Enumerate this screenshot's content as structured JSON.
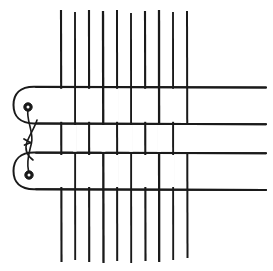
{
  "figure": {
    "background_color": "#ffffff",
    "ink_color": "#1a1a1a",
    "width": 273,
    "height": 271
  },
  "chart_data": {
    "type": "diagram",
    "xlabel": "",
    "ylabel": "",
    "xlim": [
      0,
      273
    ],
    "ylim": [
      0,
      271
    ],
    "grid": false,
    "legend": "none",
    "warp_threads": {
      "name": "warp-threads",
      "count": 10,
      "orientation": "vertical",
      "top_y": 10,
      "bottom_y": 262,
      "stroke_width": 2.0,
      "x_positions": [
        61,
        75,
        89,
        103,
        117,
        131,
        145,
        159,
        173,
        187
      ],
      "segment_breaks": [
        [],
        [],
        [],
        [],
        [],
        [],
        [],
        [],
        [],
        []
      ]
    },
    "weft_threads": {
      "name": "weft-threads",
      "count": 4,
      "orientation": "horizontal",
      "right_x": 266,
      "stroke_width": 2.0,
      "y_positions": [
        87,
        123,
        153,
        189
      ]
    },
    "shed_loops": {
      "name": "shed-return-loops",
      "count": 2,
      "description": "rounded u-turn returns joining weft pairs on the left edge",
      "loops": [
        {
          "label": "upper-loop",
          "top_y": 87,
          "bottom_y": 123,
          "left_x": 14
        },
        {
          "label": "lower-loop",
          "top_y": 153,
          "bottom_y": 189,
          "left_x": 14
        }
      ]
    },
    "heddle_eyes": {
      "name": "heddle-eyes",
      "count": 2,
      "radius": 4.0,
      "points": [
        {
          "label": "upper-eye",
          "x": 28,
          "y": 108
        },
        {
          "label": "lower-eye",
          "x": 29,
          "y": 175
        }
      ]
    },
    "tie_cord": {
      "name": "crossing-tie-cord",
      "description": "thin thread crossing in an X between the two heddle eyes",
      "crossing_point": {
        "x": 30,
        "y": 142
      },
      "strands": 2
    }
  }
}
